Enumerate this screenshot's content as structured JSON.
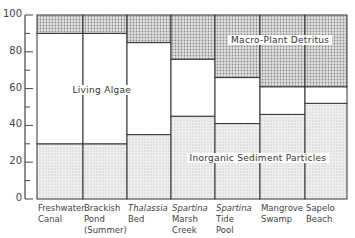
{
  "chart_data": {
    "type": "bar",
    "stacked": true,
    "title": "",
    "xlabel": "",
    "ylabel": "",
    "ylim": [
      0,
      100
    ],
    "yticks": [
      0,
      20,
      40,
      60,
      80,
      100
    ],
    "grid": false,
    "legend_position": "inline",
    "categories": [
      [
        "Freshwater",
        "Canal"
      ],
      [
        "Brackish",
        "Pond",
        "(Summer)"
      ],
      [
        "Thalassia",
        "Bed"
      ],
      [
        "Spartina",
        "Marsh",
        "Creek"
      ],
      [
        "Spartina",
        "Tide",
        "Pool"
      ],
      [
        "Mangrove",
        "Swamp"
      ],
      [
        "Sapelo",
        "Beach"
      ]
    ],
    "italic_first_line": [
      false,
      false,
      true,
      true,
      true,
      false,
      false
    ],
    "series": [
      {
        "name": "Inorganic Sediment Particles",
        "values": [
          30,
          30,
          35,
          45,
          41,
          46,
          52
        ],
        "fill": "light-stipple"
      },
      {
        "name": "Living Algae",
        "values": [
          60,
          60,
          50,
          31,
          25,
          15,
          9
        ],
        "fill": "white"
      },
      {
        "name": "Macro-Plant Detritus",
        "values": [
          10,
          10,
          15,
          24,
          34,
          39,
          39
        ],
        "fill": "dark-stipple"
      }
    ],
    "annotations": [
      {
        "text": "Living Algae",
        "x": 102,
        "y": 90
      },
      {
        "text": "Macro-Plant Detritus",
        "x": 280,
        "y": 40
      },
      {
        "text": "Inorganic Sediment Particles",
        "x": 258,
        "y": 158
      }
    ]
  },
  "colors": {
    "axis": "#444444",
    "sediment_fill": "#e4e4e4",
    "algae_fill": "#ffffff",
    "detritus_fill": "#c8c8c8",
    "outline": "#333333"
  }
}
